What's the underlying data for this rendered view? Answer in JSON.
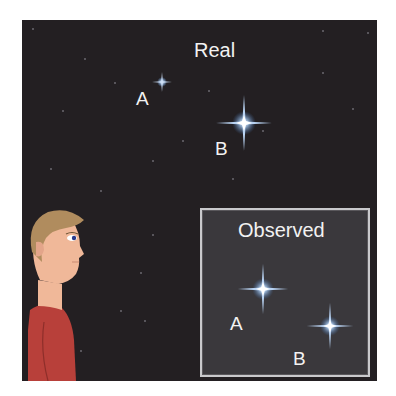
{
  "figure": {
    "real_panel": {
      "title": "Real",
      "stars": [
        {
          "label": "A",
          "size": "small"
        },
        {
          "label": "B",
          "size": "large"
        }
      ]
    },
    "observed_panel": {
      "title": "Observed",
      "stars": [
        {
          "label": "A",
          "size": "large"
        },
        {
          "label": "B",
          "size": "large"
        }
      ]
    },
    "observer": "person-profile-looking-up",
    "colors": {
      "sky": "#231f22",
      "observed_box": "#3a383c",
      "star_glow": "#8fb6e8",
      "hair": "#b08c5e",
      "skin": "#f0b899",
      "shirt": "#b8403a"
    }
  }
}
